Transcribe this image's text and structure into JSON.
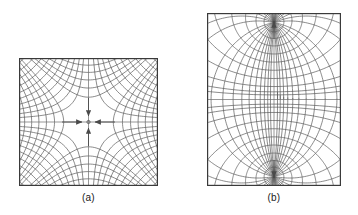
{
  "figure": {
    "type": "field-flux-map-figure",
    "background_color": "#ffffff",
    "line_color": "#555555",
    "border_color": "#3a3a3a",
    "text_color": "#1a1a1a",
    "panel_count": 2
  },
  "panels": [
    {
      "id": "a",
      "caption": "(a)",
      "description": "Curvilinear-square field map with a central saddle (null) point; equipotential lines curve away from the centre and flux lines converge on it from four directions.",
      "box": {
        "x": 19,
        "y": 58,
        "width": 139,
        "height": 128
      },
      "center": {
        "x": 88.5,
        "y": 122
      },
      "axes": {
        "horizontal": true,
        "vertical": true
      },
      "arrows": [
        {
          "name": "arrow-left",
          "direction": "left",
          "points_to": "centre"
        },
        {
          "name": "arrow-right",
          "direction": "right",
          "points_to": "centre"
        },
        {
          "name": "arrow-up",
          "direction": "up",
          "points_to": "centre"
        },
        {
          "name": "arrow-down",
          "direction": "down",
          "points_to": "centre"
        }
      ],
      "grid": {
        "family_1": "hyperbolic equipotentials",
        "family_2": "orthogonal flux lines",
        "levels": [
          0.16,
          0.3,
          0.46,
          0.64,
          0.84,
          1.06,
          1.3,
          1.56,
          1.84,
          2.14
        ],
        "saddle_marker": true
      }
    },
    {
      "id": "b",
      "caption": "(b)",
      "description": "Curvilinear-square field map between two opposite point sources on the vertical axis; a lens-shaped central region is bounded by curved equipotentials.",
      "box": {
        "x": 207,
        "y": 13,
        "width": 134,
        "height": 173
      },
      "center": {
        "x": 274,
        "y": 99.5
      },
      "poles": [
        {
          "name": "pole-top",
          "x": 274,
          "y": 22
        },
        {
          "name": "pole-bottom",
          "x": 274,
          "y": 177
        }
      ],
      "axes": {
        "horizontal": true,
        "vertical": true
      },
      "arrows": [
        {
          "name": "arrow-up",
          "direction": "up",
          "points_to": "pole-top"
        },
        {
          "name": "arrow-down",
          "direction": "down",
          "points_to": "pole-bottom"
        }
      ],
      "grid": {
        "family_1": "equipotential arcs",
        "family_2": "orthogonal flux arcs",
        "levels": [
          0.12,
          0.26,
          0.42,
          0.6,
          0.8,
          1.02,
          1.26,
          1.52,
          1.8,
          2.1
        ],
        "lens_region": true
      }
    }
  ],
  "chart_data": {
    "type": "line",
    "title": "",
    "xlabel": "",
    "ylabel": "",
    "series": [
      {
        "name": "(a) equipotentials",
        "kind": "hyperbola-family"
      },
      {
        "name": "(a) flux lines",
        "kind": "orthogonal-hyperbola-family"
      },
      {
        "name": "(b) equipotentials",
        "kind": "dipole-equipotential-family"
      },
      {
        "name": "(b) flux lines",
        "kind": "dipole-flux-family"
      }
    ]
  }
}
